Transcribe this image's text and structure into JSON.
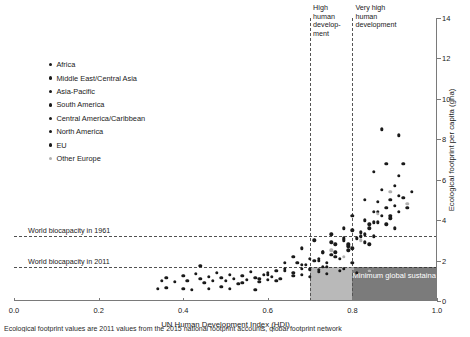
{
  "chart_data": {
    "type": "scatter",
    "title": "",
    "xlabel": "UN Human Development Index (HDI)",
    "ylabel": "Ecological footprint per capita (gha)",
    "xlim": [
      0.0,
      1.0
    ],
    "ylim": [
      0,
      14
    ],
    "xticks": [
      "0.0",
      "0.2",
      "0.4",
      "0.6",
      "0.8",
      "1.0"
    ],
    "xtick_values": [
      0.0,
      0.2,
      0.4,
      0.6,
      0.8,
      1.0
    ],
    "yticks": [
      "0",
      "2",
      "4",
      "6",
      "8",
      "10",
      "12",
      "14"
    ],
    "ytick_values": [
      0,
      2,
      4,
      6,
      8,
      10,
      12,
      14
    ],
    "grid": false,
    "legend_position": "upper-left",
    "colors": {
      "africa": "#1a1a1a",
      "middle_east_central_asia": "#1a1a1a",
      "asia_pacific": "#1a1a1a",
      "south_america": "#1a1a1a",
      "central_america_caribbean": "#1a1a1a",
      "north_america": "#1a1a1a",
      "eu": "#1a1a1a",
      "other_europe": "#b0b0b0",
      "quadrant_light": "#b9b9b9",
      "quadrant_dark": "#7b7b7b",
      "axis": "#7a7a7a"
    },
    "reference_lines": {
      "horizontal": [
        {
          "label": "World biocapacity in 1961",
          "value": 3.2
        },
        {
          "label": "World biocapacity in 2011",
          "value": 1.7
        }
      ],
      "vertical": [
        {
          "label": "High\nhuman\ndevelop-\nment",
          "value": 0.7
        },
        {
          "label": "Very high\nhuman\ndevelopment",
          "value": 0.8
        }
      ]
    },
    "shaded_regions": [
      {
        "name": "high-human-development-band",
        "x_range": [
          0.7,
          0.8
        ],
        "y_range": [
          0,
          1.7
        ],
        "color": "#b9b9b9",
        "label": ""
      },
      {
        "name": "minimum-global-sustainable-development-quadrant",
        "x_range": [
          0.8,
          1.0
        ],
        "y_range": [
          0,
          1.7
        ],
        "color": "#7b7b7b",
        "label": "Minimum\nglobal sustainable\ndevelopment quadrant"
      }
    ],
    "series": [
      {
        "name": "Africa",
        "color": "#1a1a1a",
        "points": [
          [
            0.34,
            0.6
          ],
          [
            0.35,
            1.0
          ],
          [
            0.36,
            1.15
          ],
          [
            0.38,
            0.95
          ],
          [
            0.4,
            1.25
          ],
          [
            0.41,
            1.0
          ],
          [
            0.42,
            0.55
          ],
          [
            0.43,
            1.35
          ],
          [
            0.44,
            1.1
          ],
          [
            0.45,
            0.9
          ],
          [
            0.46,
            1.2
          ],
          [
            0.47,
            1.0
          ],
          [
            0.48,
            1.4
          ],
          [
            0.49,
            1.15
          ],
          [
            0.5,
            1.0
          ],
          [
            0.51,
            1.3
          ],
          [
            0.52,
            1.1
          ],
          [
            0.53,
            0.85
          ],
          [
            0.54,
            1.25
          ],
          [
            0.55,
            1.05
          ],
          [
            0.56,
            1.45
          ],
          [
            0.57,
            1.15
          ],
          [
            0.58,
            0.95
          ],
          [
            0.59,
            1.3
          ],
          [
            0.6,
            1.05
          ],
          [
            0.61,
            1.2
          ],
          [
            0.62,
            1.5
          ],
          [
            0.63,
            1.1
          ],
          [
            0.44,
            1.75
          ],
          [
            0.66,
            1.4
          ],
          [
            0.68,
            1.6
          ],
          [
            0.7,
            1.2
          ],
          [
            0.72,
            1.55
          ],
          [
            0.74,
            1.35
          ],
          [
            0.51,
            0.6
          ],
          [
            0.36,
            0.65
          ],
          [
            0.4,
            0.6
          ],
          [
            0.46,
            0.6
          ],
          [
            0.57,
            0.55
          ]
        ]
      },
      {
        "name": "Middle East/Central Asia",
        "color": "#1a1a1a",
        "points": [
          [
            0.64,
            1.9
          ],
          [
            0.66,
            2.2
          ],
          [
            0.68,
            2.6
          ],
          [
            0.7,
            2.1
          ],
          [
            0.71,
            3.0
          ],
          [
            0.73,
            2.4
          ],
          [
            0.75,
            3.3
          ],
          [
            0.76,
            2.8
          ],
          [
            0.78,
            3.6
          ],
          [
            0.79,
            2.5
          ],
          [
            0.8,
            4.2
          ],
          [
            0.81,
            3.1
          ],
          [
            0.83,
            5.0
          ],
          [
            0.84,
            3.8
          ],
          [
            0.85,
            6.4
          ],
          [
            0.86,
            4.4
          ],
          [
            0.87,
            8.5
          ],
          [
            0.77,
            1.5
          ],
          [
            0.81,
            1.4
          ],
          [
            0.84,
            1.5
          ]
        ]
      },
      {
        "name": "Asia-Pacific",
        "color": "#1a1a1a",
        "points": [
          [
            0.49,
            0.7
          ],
          [
            0.54,
            0.9
          ],
          [
            0.58,
            1.1
          ],
          [
            0.6,
            1.3
          ],
          [
            0.62,
            1.0
          ],
          [
            0.64,
            1.5
          ],
          [
            0.66,
            1.25
          ],
          [
            0.69,
            1.8
          ],
          [
            0.7,
            1.6
          ],
          [
            0.72,
            2.0
          ],
          [
            0.73,
            1.7
          ],
          [
            0.75,
            2.3
          ],
          [
            0.77,
            2.1
          ],
          [
            0.79,
            2.7
          ],
          [
            0.8,
            1.9
          ],
          [
            0.83,
            3.3
          ],
          [
            0.85,
            3.9
          ],
          [
            0.89,
            4.2
          ],
          [
            0.91,
            5.2
          ],
          [
            0.9,
            3.6
          ],
          [
            0.72,
            1.45
          ],
          [
            0.68,
            1.3
          ]
        ]
      },
      {
        "name": "South America",
        "color": "#1a1a1a",
        "points": [
          [
            0.68,
            1.8
          ],
          [
            0.71,
            2.0
          ],
          [
            0.73,
            2.4
          ],
          [
            0.74,
            1.9
          ],
          [
            0.75,
            2.9
          ],
          [
            0.76,
            2.2
          ],
          [
            0.78,
            3.1
          ],
          [
            0.8,
            2.6
          ],
          [
            0.82,
            3.4
          ],
          [
            0.84,
            2.8
          ]
        ]
      },
      {
        "name": "Central America/Caribbean",
        "color": "#1a1a1a",
        "points": [
          [
            0.6,
            1.4
          ],
          [
            0.64,
            1.6
          ],
          [
            0.67,
            1.9
          ],
          [
            0.7,
            1.55
          ],
          [
            0.72,
            2.1
          ],
          [
            0.74,
            1.7
          ],
          [
            0.76,
            2.4
          ],
          [
            0.78,
            1.6
          ],
          [
            0.79,
            2.8
          ]
        ]
      },
      {
        "name": "North America",
        "color": "#1a1a1a",
        "points": [
          [
            0.91,
            8.2
          ],
          [
            0.92,
            6.8
          ]
        ]
      },
      {
        "name": "EU",
        "color": "#1a1a1a",
        "points": [
          [
            0.78,
            3.0
          ],
          [
            0.8,
            3.5
          ],
          [
            0.82,
            3.2
          ],
          [
            0.83,
            4.0
          ],
          [
            0.84,
            3.6
          ],
          [
            0.85,
            4.4
          ],
          [
            0.86,
            3.9
          ],
          [
            0.86,
            4.9
          ],
          [
            0.87,
            4.2
          ],
          [
            0.87,
            5.5
          ],
          [
            0.88,
            4.6
          ],
          [
            0.88,
            3.8
          ],
          [
            0.89,
            5.0
          ],
          [
            0.89,
            4.1
          ],
          [
            0.9,
            4.7
          ],
          [
            0.9,
            5.7
          ],
          [
            0.91,
            4.4
          ],
          [
            0.91,
            6.2
          ],
          [
            0.92,
            5.1
          ],
          [
            0.93,
            4.6
          ],
          [
            0.94,
            5.4
          ],
          [
            0.88,
            6.8
          ],
          [
            0.85,
            3.2
          ],
          [
            0.83,
            2.9
          ]
        ]
      },
      {
        "name": "Other Europe",
        "color": "#b0b0b0",
        "points": [
          [
            0.75,
            2.5
          ],
          [
            0.78,
            2.2
          ],
          [
            0.8,
            1.6
          ],
          [
            0.82,
            3.0
          ],
          [
            0.86,
            4.3
          ],
          [
            0.89,
            5.4
          ],
          [
            0.93,
            4.8
          ],
          [
            0.84,
            1.5
          ]
        ]
      }
    ]
  },
  "legend": {
    "items": [
      {
        "label": "Africa",
        "color": "#1a1a1a"
      },
      {
        "label": "Middle East/Central Asia",
        "color": "#1a1a1a"
      },
      {
        "label": "Asia-Pacific",
        "color": "#1a1a1a"
      },
      {
        "label": "South America",
        "color": "#1a1a1a"
      },
      {
        "label": "Central America/Caribbean",
        "color": "#1a1a1a"
      },
      {
        "label": "North America",
        "color": "#1a1a1a"
      },
      {
        "label": "EU",
        "color": "#1a1a1a"
      },
      {
        "label": "Other Europe",
        "color": "#b0b0b0"
      }
    ]
  },
  "caption": "Ecological footprint values are 2011 values from the 2015 national footprint accounts, global footprint network"
}
